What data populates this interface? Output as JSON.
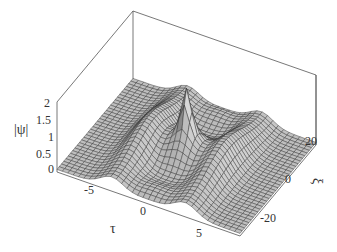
{
  "chart_data": {
    "type": "surface3d",
    "title": "",
    "xlabel": "τ",
    "ylabel": "ξ",
    "zlabel": "|ψ|",
    "xlim": [
      -8,
      8
    ],
    "ylim": [
      -30,
      30
    ],
    "zlim": [
      0,
      2
    ],
    "x_ticks": [
      "-5",
      "0",
      "5"
    ],
    "y_ticks": [
      "-20",
      "0",
      "20"
    ],
    "z_ticks": [
      "0",
      "0.5",
      "1",
      "1.5",
      "2"
    ],
    "grid": false,
    "box": true,
    "mesh": true,
    "surface_color": "#b8b8b8",
    "mesh_color": "#333333",
    "features": {
      "background_level": 0.5,
      "ridge_height": 1.0,
      "ridge_positions_tau": [
        -3.5,
        3.5
      ],
      "peak_position": [
        0,
        0
      ],
      "peak_value": 2.0
    }
  },
  "labels": {
    "z_axis_title": "|ψ|",
    "x_axis_title": "τ",
    "y_axis_title": "ξ",
    "z_ticks": [
      {
        "text": "2",
        "x": 44,
        "y": 97
      },
      {
        "text": "1.5",
        "x": 36,
        "y": 114
      },
      {
        "text": "1",
        "x": 48,
        "y": 131
      },
      {
        "text": "0.5",
        "x": 36,
        "y": 148
      },
      {
        "text": "0",
        "x": 48,
        "y": 163
      }
    ],
    "x_ticks": [
      {
        "text": "-5",
        "x": 84,
        "y": 184
      },
      {
        "text": "0",
        "x": 140,
        "y": 205
      },
      {
        "text": "5",
        "x": 196,
        "y": 227
      }
    ],
    "y_ticks": [
      {
        "text": "20",
        "x": 305,
        "y": 135
      },
      {
        "text": "0",
        "x": 285,
        "y": 173
      },
      {
        "text": "-20",
        "x": 260,
        "y": 212
      }
    ]
  }
}
